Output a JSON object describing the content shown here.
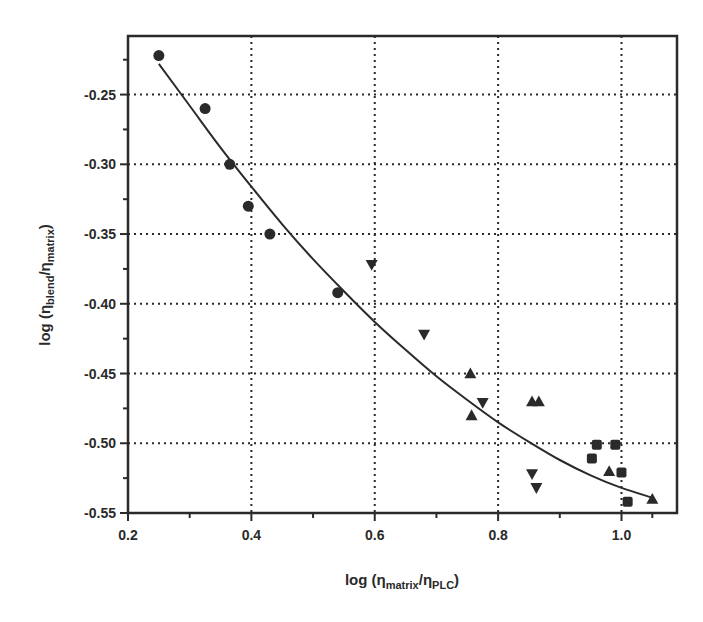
{
  "chart_data": {
    "type": "scatter",
    "title": "",
    "xlabel": "log (η_matrix/η_PLC)",
    "ylabel": "log (η_blend/η_matrix)",
    "xlabel_parts": {
      "prefix": "log (η",
      "sub1": "matrix",
      "mid": "/η",
      "sub2": "PLC",
      "suffix": ")"
    },
    "ylabel_parts": {
      "prefix": "log (η",
      "sub1": "blend",
      "mid": "/η",
      "sub2": "matrix",
      "suffix": ")"
    },
    "xlim": [
      0.2,
      1.09
    ],
    "ylim": [
      -0.55,
      -0.208
    ],
    "x_ticks": [
      0.2,
      0.4,
      0.6,
      0.8,
      1.0
    ],
    "x_tick_labels": [
      "0.2",
      "0.4",
      "0.6",
      "0.8",
      "1.0"
    ],
    "x_minor_ticks": [
      0.3,
      0.5,
      0.7,
      0.9,
      1.05
    ],
    "y_ticks": [
      -0.25,
      -0.3,
      -0.35,
      -0.4,
      -0.45,
      -0.5,
      -0.55
    ],
    "y_tick_labels": [
      "-0.25",
      "-0.30",
      "-0.35",
      "-0.40",
      "-0.45",
      "-0.50",
      "-0.55"
    ],
    "y_minor_ticks": [
      -0.225,
      -0.275,
      -0.325,
      -0.375,
      -0.425,
      -0.475,
      -0.525
    ],
    "grid": true,
    "grid_style": "dotted",
    "legend": null,
    "series": [
      {
        "name": "circles",
        "marker": "circle",
        "points": [
          [
            0.25,
            -0.222
          ],
          [
            0.325,
            -0.26
          ],
          [
            0.365,
            -0.3
          ],
          [
            0.395,
            -0.33
          ],
          [
            0.43,
            -0.35
          ],
          [
            0.54,
            -0.392
          ]
        ]
      },
      {
        "name": "down-triangles",
        "marker": "triangle-down",
        "points": [
          [
            0.595,
            -0.372
          ],
          [
            0.68,
            -0.422
          ],
          [
            0.775,
            -0.471
          ],
          [
            0.855,
            -0.522
          ],
          [
            0.862,
            -0.532
          ]
        ]
      },
      {
        "name": "up-triangles",
        "marker": "triangle-up",
        "points": [
          [
            0.755,
            -0.45
          ],
          [
            0.757,
            -0.48
          ],
          [
            0.855,
            -0.47
          ],
          [
            0.866,
            -0.47
          ],
          [
            0.98,
            -0.52
          ],
          [
            1.05,
            -0.54
          ]
        ]
      },
      {
        "name": "squares",
        "marker": "square",
        "points": [
          [
            0.96,
            -0.501
          ],
          [
            0.99,
            -0.501
          ],
          [
            0.952,
            -0.511
          ],
          [
            1.0,
            -0.521
          ],
          [
            1.01,
            -0.542
          ]
        ]
      }
    ],
    "fit_curve": {
      "name": "fitted curve",
      "points": [
        [
          0.25,
          -0.228
        ],
        [
          0.3,
          -0.258
        ],
        [
          0.35,
          -0.288
        ],
        [
          0.4,
          -0.316
        ],
        [
          0.45,
          -0.343
        ],
        [
          0.5,
          -0.368
        ],
        [
          0.55,
          -0.391
        ],
        [
          0.6,
          -0.413
        ],
        [
          0.65,
          -0.433
        ],
        [
          0.7,
          -0.452
        ],
        [
          0.75,
          -0.469
        ],
        [
          0.8,
          -0.485
        ],
        [
          0.85,
          -0.499
        ],
        [
          0.9,
          -0.512
        ],
        [
          0.95,
          -0.523
        ],
        [
          1.0,
          -0.532
        ],
        [
          1.05,
          -0.539
        ]
      ]
    }
  },
  "colors": {
    "ink": "#2a2a2a",
    "background": "#ffffff"
  }
}
